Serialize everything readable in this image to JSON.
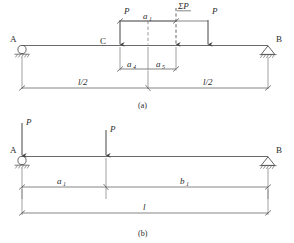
{
  "figure": {
    "colors": {
      "line": "#555555",
      "beam": "#6a6a6a",
      "text": "#2b2b2b",
      "background": "#ffffff"
    },
    "panels": [
      {
        "id": "panel-a",
        "caption": "(a)",
        "supports": [
          {
            "name": "A",
            "label": "A",
            "type": "roller"
          },
          {
            "name": "B",
            "label": "B",
            "type": "pin"
          }
        ],
        "beam_points": [
          {
            "name": "C",
            "label": "C"
          }
        ],
        "loads": [
          {
            "name": "load-left",
            "label": "P"
          },
          {
            "name": "load-resultant",
            "label": "ΣP"
          },
          {
            "name": "load-right",
            "label": "P"
          }
        ],
        "dimensions": [
          {
            "name": "dim-a1",
            "label": "a",
            "sub": "1"
          },
          {
            "name": "dim-a4",
            "label": "a",
            "sub": "4"
          },
          {
            "name": "dim-a5",
            "label": "a",
            "sub": "5"
          },
          {
            "name": "dim-half-left",
            "label": "l/2"
          },
          {
            "name": "dim-half-right",
            "label": "l/2"
          }
        ]
      },
      {
        "id": "panel-b",
        "caption": "(b)",
        "supports": [
          {
            "name": "A",
            "label": "A",
            "type": "roller"
          },
          {
            "name": "B",
            "label": "B",
            "type": "pin"
          }
        ],
        "beam_points": [],
        "loads": [
          {
            "name": "load-at-a",
            "label": "P"
          },
          {
            "name": "load-mid",
            "label": "P"
          }
        ],
        "dimensions": [
          {
            "name": "dim-a1",
            "label": "a",
            "sub": "1"
          },
          {
            "name": "dim-b1",
            "label": "b",
            "sub": "1"
          },
          {
            "name": "dim-span",
            "label": "l"
          }
        ]
      }
    ]
  }
}
